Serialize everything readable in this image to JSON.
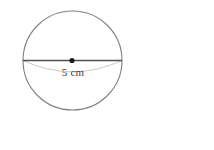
{
  "figure": {
    "shape_name": "sphere",
    "dimension_label": "5 cm",
    "dimension_type": "diameter",
    "dimension_value": 5,
    "dimension_unit": "cm",
    "outline_color": "#808080",
    "diameter_line_color": "#4f4f4f",
    "equator_color": "#c8c8c8",
    "center_dot_color": "#1a1a1a"
  },
  "answer": {
    "open_paren": "(",
    "close_paren": ")",
    "unit": "cm",
    "value": ""
  }
}
